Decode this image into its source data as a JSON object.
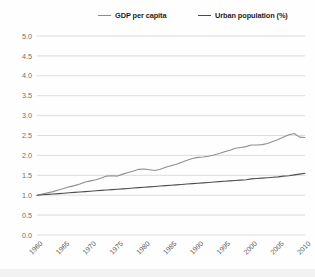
{
  "legend": {
    "position": "top",
    "items": [
      {
        "label": "GDP per capita",
        "color": "#8f8f8f"
      },
      {
        "label": "Urban population (%)",
        "color": "#4f4f4f"
      }
    ]
  },
  "axis": {
    "y_ticks": [
      "5.0",
      "4.5",
      "4.0",
      "3.5",
      "3.0",
      "2.5",
      "2.0",
      "1.5",
      "1.0",
      "0.5",
      "0.0"
    ],
    "x_ticks": [
      "1960",
      "1965",
      "1970",
      "1975",
      "1980",
      "1985",
      "1990",
      "1995",
      "2000",
      "2005",
      "2010"
    ]
  },
  "chart_data": {
    "type": "line",
    "title": "",
    "subtitle": "",
    "xlabel": "",
    "ylabel": "",
    "xlim": [
      1960,
      2010
    ],
    "ylim": [
      0.0,
      5.0
    ],
    "grid": true,
    "legend_position": "top",
    "x": [
      1960,
      1961,
      1962,
      1963,
      1964,
      1965,
      1966,
      1967,
      1968,
      1969,
      1970,
      1971,
      1972,
      1973,
      1974,
      1975,
      1976,
      1977,
      1978,
      1979,
      1980,
      1981,
      1982,
      1983,
      1984,
      1985,
      1986,
      1987,
      1988,
      1989,
      1990,
      1991,
      1992,
      1993,
      1994,
      1995,
      1996,
      1997,
      1998,
      1999,
      2000,
      2001,
      2002,
      2003,
      2004,
      2005,
      2006,
      2007,
      2008,
      2009,
      2010
    ],
    "series": [
      {
        "name": "GDP per capita",
        "color": "#8f8f8f",
        "values": [
          1.0,
          1.03,
          1.06,
          1.09,
          1.13,
          1.17,
          1.21,
          1.24,
          1.28,
          1.33,
          1.36,
          1.39,
          1.43,
          1.48,
          1.49,
          1.48,
          1.53,
          1.57,
          1.61,
          1.65,
          1.66,
          1.64,
          1.62,
          1.65,
          1.7,
          1.74,
          1.78,
          1.83,
          1.88,
          1.92,
          1.95,
          1.96,
          1.98,
          2.01,
          2.05,
          2.09,
          2.13,
          2.18,
          2.2,
          2.22,
          2.26,
          2.26,
          2.27,
          2.3,
          2.35,
          2.4,
          2.46,
          2.52,
          2.55,
          2.46,
          2.45
        ]
      },
      {
        "name": "Urban population (%)",
        "color": "#4f4f4f",
        "values": [
          1.0,
          1.01,
          1.02,
          1.03,
          1.04,
          1.05,
          1.06,
          1.07,
          1.08,
          1.09,
          1.1,
          1.11,
          1.12,
          1.13,
          1.14,
          1.15,
          1.16,
          1.17,
          1.18,
          1.19,
          1.2,
          1.21,
          1.22,
          1.23,
          1.24,
          1.25,
          1.26,
          1.27,
          1.28,
          1.29,
          1.3,
          1.31,
          1.32,
          1.33,
          1.34,
          1.35,
          1.36,
          1.37,
          1.38,
          1.39,
          1.41,
          1.42,
          1.43,
          1.44,
          1.45,
          1.46,
          1.48,
          1.49,
          1.51,
          1.53,
          1.55
        ]
      }
    ]
  }
}
